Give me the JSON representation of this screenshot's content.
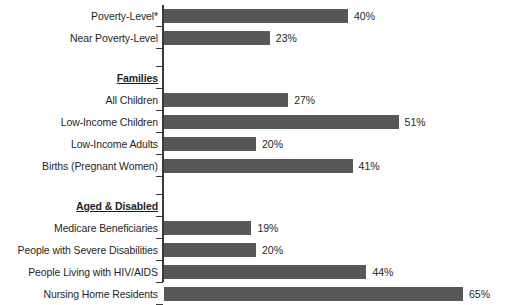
{
  "chart_data": {
    "type": "bar",
    "orientation": "horizontal",
    "title": "",
    "subtitle": "",
    "xlabel": "",
    "ylabel": "",
    "xlim": [
      0,
      70
    ],
    "grid": false,
    "legend": null,
    "value_suffix": "%",
    "bar_color": "#585858",
    "axis_color": "#3a3a3a",
    "text_color": "#1f1f1f",
    "categories": [
      "Poverty-Level*",
      "Near Poverty-Level",
      "All Children",
      "Low-Income Children",
      "Low-Income Adults",
      "Births (Pregnant Women)",
      "Medicare Beneficiaries",
      "People with Severe Disabilities",
      "People Living with HIV/AIDS",
      "Nursing Home Residents"
    ],
    "values": [
      40,
      23,
      27,
      51,
      20,
      41,
      19,
      20,
      44,
      65
    ],
    "value_labels": [
      "40%",
      "23%",
      "27%",
      "51%",
      "20%",
      "41%",
      "19%",
      "20%",
      "44%",
      "65%"
    ],
    "group_headers": [
      "Families",
      "Aged & Disabled"
    ],
    "rows": [
      {
        "kind": "bar",
        "label": "Poverty-Level*",
        "value": 40,
        "value_label": "40%",
        "top": 8
      },
      {
        "kind": "bar",
        "label": "Near Poverty-Level",
        "value": 23,
        "value_label": "23%",
        "top": 30
      },
      {
        "kind": "spacer",
        "label": "",
        "value": null,
        "value_label": "",
        "top": 52
      },
      {
        "kind": "header",
        "label": "Families",
        "value": null,
        "value_label": "",
        "top": 70
      },
      {
        "kind": "bar",
        "label": "All Children",
        "value": 27,
        "value_label": "27%",
        "top": 92
      },
      {
        "kind": "bar",
        "label": "Low-Income Children",
        "value": 51,
        "value_label": "51%",
        "top": 114
      },
      {
        "kind": "bar",
        "label": "Low-Income Adults",
        "value": 20,
        "value_label": "20%",
        "top": 136
      },
      {
        "kind": "bar",
        "label": "Births (Pregnant Women)",
        "value": 41,
        "value_label": "41%",
        "top": 158
      },
      {
        "kind": "spacer",
        "label": "",
        "value": null,
        "value_label": "",
        "top": 180
      },
      {
        "kind": "header",
        "label": "Aged & Disabled",
        "value": null,
        "value_label": "",
        "top": 190
      },
      {
        "kind": "bar",
        "label": "Medicare Beneficiaries",
        "value": 19,
        "value_label": "19%",
        "top": 212
      },
      {
        "kind": "bar",
        "label": "People with Severe Disabilities",
        "value": 20,
        "value_label": "20%",
        "top": 234
      },
      {
        "kind": "bar",
        "label": "People Living with HIV/AIDS",
        "value": 44,
        "value_label": "44%",
        "top": 256
      },
      {
        "kind": "bar",
        "label": "Nursing Home Residents",
        "value": 65,
        "value_label": "65%",
        "top": 278
      }
    ]
  }
}
